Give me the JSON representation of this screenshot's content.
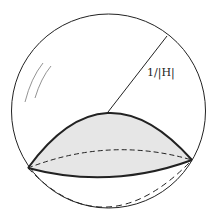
{
  "diagram": {
    "radius_label": "1/|H|",
    "elements": [
      "outer-sphere",
      "spherical-cap (shaded)",
      "radius-line",
      "dashed-back-ellipse",
      "dashed-lower-arc",
      "highlight-strokes"
    ],
    "colors": {
      "stroke": "#222222",
      "cap_fill": "#e6e6e6",
      "background": "#ffffff"
    }
  }
}
